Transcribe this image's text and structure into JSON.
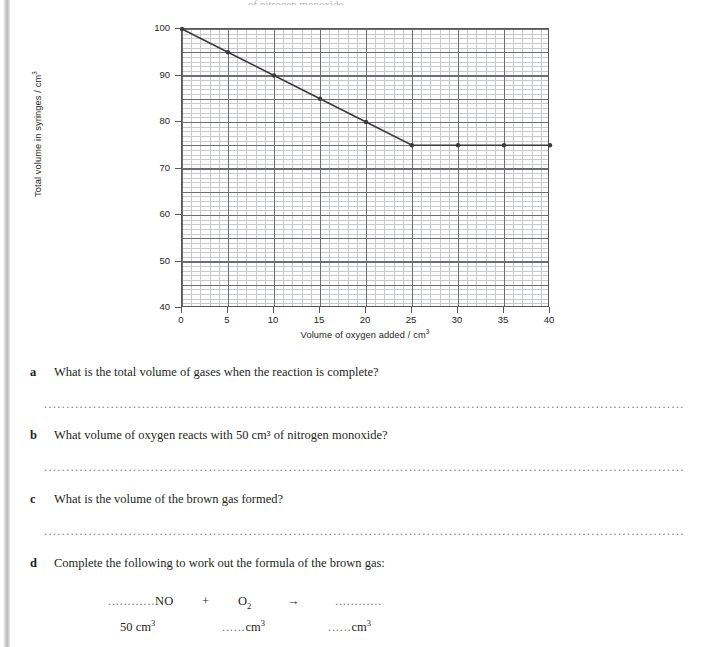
{
  "page": {
    "top_cut_text": "of nitrogen monoxide"
  },
  "chart_data": {
    "type": "line",
    "title": "",
    "xlabel_text": "Volume of oxygen added / cm",
    "xlabel_sup": "3",
    "ylabel_text": "Total volume in syringes / cm",
    "ylabel_sup": "3",
    "x": [
      0,
      5,
      10,
      15,
      20,
      25,
      30,
      35,
      40
    ],
    "values": [
      100,
      95,
      90,
      85,
      80,
      75,
      75,
      75,
      75
    ],
    "xlim": [
      0,
      40
    ],
    "ylim": [
      40,
      100
    ],
    "xticks": [
      "0",
      "5",
      "10",
      "15",
      "20",
      "25",
      "30",
      "35",
      "40"
    ],
    "yticks": [
      "40",
      "50",
      "60",
      "70",
      "80",
      "90",
      "100"
    ],
    "grid": "graph-paper-major-and-minor",
    "legend": "none",
    "series_color": "#3a3a3c",
    "marker": "filled-circle"
  },
  "questions": [
    {
      "label": "a",
      "text": "What is the total volume of gases when the reaction is complete?",
      "answer_dots": "...................................................................................................................................................................................................................."
    },
    {
      "label": "b",
      "text": "What volume of oxygen reacts with 50 cm³ of nitrogen monoxide?",
      "answer_dots": "...................................................................................................................................................................................................................."
    },
    {
      "label": "c",
      "text": "What is the volume of the brown gas formed?",
      "answer_dots": "...................................................................................................................................................................................................................."
    },
    {
      "label": "d",
      "text": "Complete the following to work out the formula of the brown gas:",
      "answer_dots": ""
    }
  ],
  "equation": {
    "reactant1_blank": "............",
    "reactant1": "NO",
    "plus": "+",
    "reactant2": "O",
    "reactant2_sub": "2",
    "arrow": "→",
    "product_blank": "............",
    "volume1": "50 cm",
    "volume1_sup": "3",
    "volume2_blank": "......",
    "volume2": "cm",
    "volume2_sup": "3",
    "volume3_blank": "......",
    "volume3": "cm",
    "volume3_sup": "3"
  }
}
